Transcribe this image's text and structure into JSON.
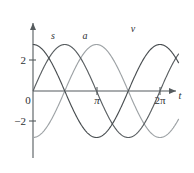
{
  "figure": {
    "background_color": "#ffffff",
    "axis_color": "#555b5e"
  },
  "axes": {
    "x_axis_label": "t",
    "y_axis_label": "",
    "x_ticks": [
      {
        "value": 3.14159,
        "label": "π"
      },
      {
        "value": 6.28319,
        "label": "2π"
      }
    ],
    "y_ticks": [
      {
        "value": 2,
        "label": "2"
      },
      {
        "value": 0,
        "label": "0"
      },
      {
        "value": -2,
        "label": "−2"
      }
    ],
    "origin_label": "0"
  },
  "curve_labels": [
    {
      "name": "s",
      "text": "s",
      "x": 0.62,
      "y": 3.35
    },
    {
      "name": "a",
      "text": "a",
      "x": 2.22,
      "y": 3.35
    },
    {
      "name": "v",
      "text": "v",
      "x": 4.68,
      "y": 3.95
    }
  ],
  "chart_data": {
    "type": "line",
    "title": "",
    "xlabel": "t",
    "ylabel": "",
    "xlim": [
      -0.32,
      7.2
    ],
    "ylim": [
      -3.9,
      4.4
    ],
    "grid": false,
    "legend": "inline-curve-labels",
    "x_tick_values": [
      3.14159,
      6.28319
    ],
    "x_tick_labels": [
      "π",
      "2π"
    ],
    "y_tick_values": [
      2,
      0,
      -2
    ],
    "y_tick_labels": [
      "2",
      "0",
      "−2"
    ],
    "amplitude": 3,
    "series": [
      {
        "name": "s",
        "formula": "s = 3 cos(t)",
        "color": "#4a4f52",
        "phase_deg": 0,
        "x": [
          0,
          0.3927,
          0.7854,
          1.1781,
          1.5708,
          1.9635,
          2.3562,
          2.7489,
          3.1416,
          3.5343,
          3.927,
          4.3197,
          4.7124,
          5.1051,
          5.4978,
          5.8905,
          6.2832,
          6.676,
          7.0686
        ],
        "values": [
          3,
          2.772,
          2.121,
          1.148,
          0,
          -1.148,
          -2.121,
          -2.772,
          -3,
          -2.772,
          -2.121,
          -1.148,
          0,
          1.148,
          2.121,
          2.772,
          3,
          2.772,
          2.121
        ]
      },
      {
        "name": "v",
        "formula": "v = −3 sin(t)",
        "color": "#5a5f62",
        "phase_deg": -90,
        "x": [
          0,
          0.3927,
          0.7854,
          1.1781,
          1.5708,
          1.9635,
          2.3562,
          2.7489,
          3.1416,
          3.5343,
          3.927,
          4.3197,
          4.7124,
          5.1051,
          5.4978,
          5.8905,
          6.2832,
          6.676,
          7.0686
        ],
        "values": [
          0,
          -1.148,
          -2.121,
          -2.772,
          -3,
          -2.772,
          -2.121,
          -1.148,
          0,
          1.148,
          2.121,
          2.772,
          3,
          2.772,
          2.121,
          1.148,
          0,
          -1.148,
          -2.121
        ]
      },
      {
        "name": "a",
        "formula": "a = −3 cos(t)",
        "color": "#9ea3a6",
        "phase_deg": 180,
        "x": [
          0,
          0.3927,
          0.7854,
          1.1781,
          1.5708,
          1.9635,
          2.3562,
          2.7489,
          3.1416,
          3.5343,
          3.927,
          4.3197,
          4.7124,
          5.1051,
          5.4978,
          5.8905,
          6.2832,
          6.676,
          7.0686
        ],
        "values": [
          -3,
          -2.772,
          -2.121,
          -1.148,
          0,
          1.148,
          2.121,
          2.772,
          3,
          2.772,
          2.121,
          1.148,
          0,
          -1.148,
          -2.121,
          -2.772,
          -3,
          -2.772,
          -2.121
        ]
      }
    ]
  }
}
